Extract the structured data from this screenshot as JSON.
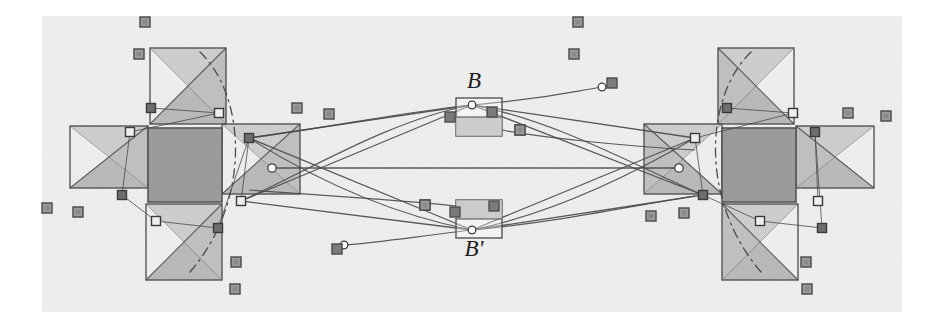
{
  "figure": {
    "canvas": {
      "width": 941,
      "height": 333,
      "background": "#ffffff"
    },
    "panel": {
      "x": 42,
      "y": 16,
      "width": 860,
      "height": 296,
      "fill": "#f0f0f0"
    },
    "colors": {
      "stroke": "#4a4a4a",
      "stroke_light": "#6f6f6f",
      "square_outline": "#555555",
      "center_fill": "#9b9b9b",
      "flap_shade_dark": "#8e8e8e",
      "flap_shade_light": "#c2c2c2",
      "marker_fill": "#9c9c9c",
      "marker_stroke": "#4f4f4f",
      "node_fill": "#ffffff",
      "node_stroke": "#3f3f3f",
      "label_color": "#1c1c1c",
      "panel_fill": "#f0f0f0"
    },
    "labels": [
      {
        "id": "label-B",
        "text": "B",
        "x": 474,
        "y": 88,
        "size": 23,
        "anchor": "middle"
      },
      {
        "id": "label-Bprime",
        "text": "B'",
        "x": 474,
        "y": 256,
        "size": 23,
        "anchor": "middle"
      }
    ],
    "clusters": [
      {
        "name": "left-cluster",
        "center_square": {
          "x": 148,
          "y": 128,
          "size": 74
        },
        "flaps": [
          {
            "name": "left-cluster-flap-top",
            "x": 150,
            "y": 48,
            "w": 76,
            "h": 76
          },
          {
            "name": "left-cluster-flap-bottom",
            "x": 146,
            "y": 204,
            "w": 76,
            "h": 76
          },
          {
            "name": "left-cluster-flap-left",
            "x": 70,
            "y": 126,
            "w": 78,
            "h": 62
          },
          {
            "name": "left-cluster-flap-right",
            "x": 222,
            "y": 124,
            "w": 78,
            "h": 70
          }
        ],
        "hinge_nodes": [
          {
            "x": 151,
            "y": 108,
            "kind": "dark"
          },
          {
            "x": 219,
            "y": 113,
            "kind": "light"
          },
          {
            "x": 130,
            "y": 132,
            "kind": "light"
          },
          {
            "x": 122,
            "y": 195,
            "kind": "dark"
          },
          {
            "x": 156,
            "y": 221,
            "kind": "light"
          },
          {
            "x": 218,
            "y": 228,
            "kind": "dark"
          },
          {
            "x": 249,
            "y": 138,
            "kind": "dark"
          },
          {
            "x": 241,
            "y": 201,
            "kind": "light"
          }
        ],
        "pivot": {
          "x": 272,
          "y": 168
        }
      },
      {
        "name": "right-cluster",
        "center_square": {
          "x": 722,
          "y": 128,
          "size": 74
        },
        "flaps": [
          {
            "name": "right-cluster-flap-top",
            "x": 718,
            "y": 48,
            "w": 76,
            "h": 76
          },
          {
            "name": "right-cluster-flap-bottom",
            "x": 722,
            "y": 204,
            "w": 76,
            "h": 76
          },
          {
            "name": "right-cluster-flap-left",
            "x": 644,
            "y": 124,
            "w": 78,
            "h": 70
          },
          {
            "name": "right-cluster-flap-right",
            "x": 796,
            "y": 126,
            "w": 78,
            "h": 62
          }
        ],
        "hinge_nodes": [
          {
            "x": 727,
            "y": 108,
            "kind": "dark"
          },
          {
            "x": 793,
            "y": 113,
            "kind": "light"
          },
          {
            "x": 695,
            "y": 138,
            "kind": "light"
          },
          {
            "x": 703,
            "y": 195,
            "kind": "dark"
          },
          {
            "x": 760,
            "y": 221,
            "kind": "light"
          },
          {
            "x": 822,
            "y": 228,
            "kind": "dark"
          },
          {
            "x": 815,
            "y": 132,
            "kind": "dark"
          },
          {
            "x": 818,
            "y": 201,
            "kind": "light"
          }
        ],
        "pivot": {
          "x": 679,
          "y": 168
        }
      }
    ],
    "hubs": [
      {
        "name": "hub-B",
        "x": 456,
        "y": 98,
        "w": 46,
        "h": 38
      },
      {
        "name": "hub-Bprime",
        "x": 456,
        "y": 200,
        "w": 46,
        "h": 38
      }
    ],
    "hub_nodes": [
      {
        "x": 472,
        "y": 105,
        "kind": "open"
      },
      {
        "x": 472,
        "y": 230,
        "kind": "open"
      }
    ],
    "hub_markers": [
      {
        "x": 450,
        "y": 117,
        "kind": "dark"
      },
      {
        "x": 492,
        "y": 112,
        "kind": "dark"
      },
      {
        "x": 455,
        "y": 212,
        "kind": "dark"
      },
      {
        "x": 494,
        "y": 206,
        "kind": "dark"
      },
      {
        "x": 520,
        "y": 130,
        "kind": "light"
      },
      {
        "x": 425,
        "y": 205,
        "kind": "light"
      }
    ],
    "curve_tails": [
      {
        "name": "tail-upper-right",
        "node": {
          "x": 602,
          "y": 87
        },
        "marker": {
          "x": 612,
          "y": 83
        }
      },
      {
        "name": "tail-lower-left",
        "node": {
          "x": 344,
          "y": 245
        },
        "marker": {
          "x": 337,
          "y": 249
        }
      }
    ],
    "markers": [
      {
        "x": 145,
        "y": 22
      },
      {
        "x": 139,
        "y": 54
      },
      {
        "x": 578,
        "y": 22
      },
      {
        "x": 574,
        "y": 54
      },
      {
        "x": 47,
        "y": 208
      },
      {
        "x": 78,
        "y": 212
      },
      {
        "x": 297,
        "y": 108
      },
      {
        "x": 329,
        "y": 114
      },
      {
        "x": 235,
        "y": 289
      },
      {
        "x": 236,
        "y": 262
      },
      {
        "x": 806,
        "y": 262
      },
      {
        "x": 807,
        "y": 289
      },
      {
        "x": 651,
        "y": 216
      },
      {
        "x": 684,
        "y": 213
      },
      {
        "x": 848,
        "y": 113
      },
      {
        "x": 886,
        "y": 116
      },
      {
        "x": 520,
        "y": 130
      },
      {
        "x": 425,
        "y": 205
      }
    ],
    "connector_lines": [
      {
        "from": {
          "x": 249,
          "y": 138
        },
        "to": {
          "x": 472,
          "y": 105
        }
      },
      {
        "from": {
          "x": 249,
          "y": 138
        },
        "to": {
          "x": 472,
          "y": 230
        }
      },
      {
        "from": {
          "x": 241,
          "y": 201
        },
        "to": {
          "x": 472,
          "y": 105
        }
      },
      {
        "from": {
          "x": 241,
          "y": 201
        },
        "to": {
          "x": 472,
          "y": 230
        }
      },
      {
        "from": {
          "x": 695,
          "y": 138
        },
        "to": {
          "x": 472,
          "y": 105
        }
      },
      {
        "from": {
          "x": 695,
          "y": 138
        },
        "to": {
          "x": 472,
          "y": 230
        }
      },
      {
        "from": {
          "x": 703,
          "y": 195
        },
        "to": {
          "x": 472,
          "y": 105
        }
      },
      {
        "from": {
          "x": 703,
          "y": 195
        },
        "to": {
          "x": 472,
          "y": 230
        }
      },
      {
        "from": {
          "x": 272,
          "y": 168
        },
        "to": {
          "x": 679,
          "y": 168
        }
      }
    ]
  }
}
